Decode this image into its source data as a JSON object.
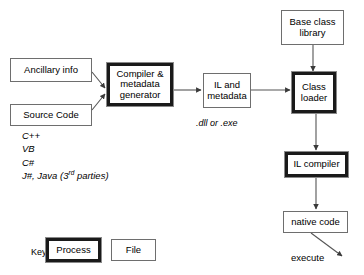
{
  "diagram": {
    "background_color": "#ffffff",
    "line_color": "#555555",
    "process_border_color": "#1a1a1a",
    "file_border_color": "#6e6e6e"
  },
  "nodes": {
    "ancillary_info": {
      "label": "Ancillary info",
      "type": "file"
    },
    "source_code": {
      "label": "Source Code",
      "type": "file"
    },
    "compiler": {
      "label": "Compiler & metadata generator",
      "type": "process"
    },
    "il_metadata": {
      "label": "IL and metadata",
      "type": "file"
    },
    "base_class_library": {
      "label": "Base class library",
      "type": "file"
    },
    "class_loader": {
      "label": "Class loader",
      "type": "process"
    },
    "il_compiler": {
      "label": "IL compiler",
      "type": "process"
    },
    "native_code": {
      "label": "native code",
      "type": "file"
    }
  },
  "captions": {
    "dll_or_exe": ".dll or .exe",
    "execute": "execute"
  },
  "languages": [
    "C++",
    "VB",
    "C#"
  ],
  "languages_last": {
    "prefix": "J#, Java (3",
    "superscript": "rd",
    "suffix": " parties)"
  },
  "key": {
    "label": "Key:",
    "process_label": "Process",
    "file_label": "File"
  }
}
